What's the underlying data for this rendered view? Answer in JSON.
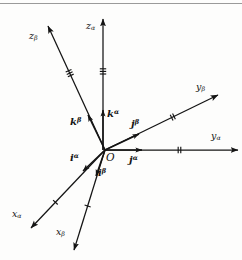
{
  "figure": {
    "background_color": "#fdfdfc",
    "stroke_color": "#141414",
    "top_rule_color": "#9a9a9a",
    "origin": {
      "label": "O",
      "x": 105,
      "y": 150
    }
  },
  "axes": [
    {
      "name": "z-alpha",
      "base": "z",
      "frame": "α",
      "label_x": 86,
      "label_y": 21,
      "x1": 103,
      "y1": 150,
      "x2": 103,
      "y2": 19,
      "ticks": 3,
      "tick_t": 0.6
    },
    {
      "name": "z-beta",
      "base": "z",
      "frame": "β",
      "label_x": 29,
      "label_y": 31,
      "x1": 105,
      "y1": 150,
      "x2": 48,
      "y2": 26,
      "ticks": 3,
      "tick_t": 0.62
    },
    {
      "name": "y-beta",
      "base": "y",
      "frame": "β",
      "label_x": 196,
      "label_y": 82,
      "x1": 105,
      "y1": 150,
      "x2": 218,
      "y2": 95,
      "ticks": 2,
      "tick_t": 0.6
    },
    {
      "name": "y-alpha",
      "base": "y",
      "frame": "α",
      "label_x": 211,
      "label_y": 131,
      "x1": 105,
      "y1": 150,
      "x2": 238,
      "y2": 150,
      "ticks": 2,
      "tick_t": 0.56
    },
    {
      "name": "x-alpha",
      "base": "x",
      "frame": "α",
      "label_x": 12,
      "label_y": 209,
      "x1": 105,
      "y1": 150,
      "x2": 31,
      "y2": 228,
      "ticks": 1,
      "tick_t": 0.67
    },
    {
      "name": "x-beta",
      "base": "x",
      "frame": "β",
      "label_x": 56,
      "label_y": 227,
      "x1": 105,
      "y1": 150,
      "x2": 74,
      "y2": 250,
      "ticks": 1,
      "tick_t": 0.56
    }
  ],
  "unit_vectors": [
    {
      "name": "k-alpha",
      "base": "k",
      "frame": "α",
      "label_x": 107,
      "label_y": 109,
      "x1": 103,
      "y1": 150,
      "x2": 103,
      "y2": 110
    },
    {
      "name": "k-beta",
      "base": "k",
      "frame": "β",
      "label_x": 70,
      "label_y": 117,
      "x1": 105,
      "y1": 150,
      "x2": 88,
      "y2": 115
    },
    {
      "name": "j-beta",
      "base": "j",
      "frame": "β",
      "label_x": 131,
      "label_y": 119,
      "x1": 105,
      "y1": 150,
      "x2": 139,
      "y2": 134
    },
    {
      "name": "j-alpha",
      "base": "j",
      "frame": "α",
      "label_x": 129,
      "label_y": 155,
      "x1": 105,
      "y1": 150,
      "x2": 142,
      "y2": 150
    },
    {
      "name": "i-alpha",
      "base": "i",
      "frame": "α",
      "label_x": 70,
      "label_y": 153,
      "x1": 105,
      "y1": 150,
      "x2": 83,
      "y2": 171
    },
    {
      "name": "i-beta",
      "base": "i",
      "frame": "β",
      "label_x": 98,
      "label_y": 168,
      "x1": 105,
      "y1": 150,
      "x2": 96,
      "y2": 176
    }
  ]
}
